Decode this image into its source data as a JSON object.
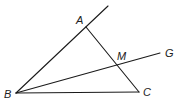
{
  "diagram": {
    "type": "geometry",
    "points": {
      "A": {
        "label": "A",
        "x": 86,
        "y": 27
      },
      "B": {
        "label": "B",
        "x": 16,
        "y": 93
      },
      "C": {
        "label": "C",
        "x": 139,
        "y": 92
      },
      "M": {
        "label": "M",
        "x": 119,
        "y": 65
      },
      "G": {
        "label": "G",
        "x": 160,
        "y": 53
      }
    },
    "segments": [
      {
        "from": "B",
        "to": "A",
        "extended_beyond": "A"
      },
      {
        "from": "A",
        "to": "C"
      },
      {
        "from": "B",
        "to": "C"
      },
      {
        "from": "B",
        "to": "G",
        "passes_through": "M"
      }
    ],
    "labels": {
      "A": "A",
      "B": "B",
      "C": "C",
      "M": "M",
      "G": "G"
    },
    "colors": {
      "line": "#1a1a1a",
      "text": "#222222",
      "background": "#ffffff"
    }
  }
}
